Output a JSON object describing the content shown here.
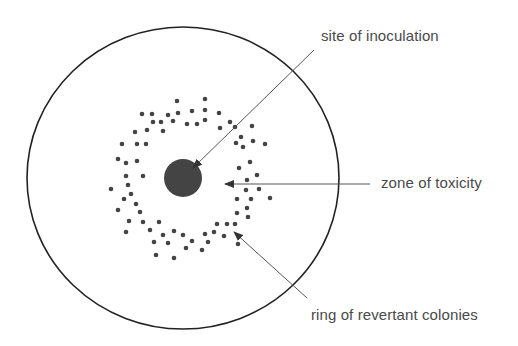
{
  "diagram": {
    "colors": {
      "outline": "#222222",
      "dots": "#444444",
      "blob": "#444444",
      "leader": "#555555",
      "text": "#4a4a4a"
    },
    "plate": {
      "cx": 183,
      "cy": 178,
      "rx": 156,
      "ry": 151
    },
    "site": {
      "cx": 183,
      "cy": 178,
      "r": 19
    },
    "labels": [
      {
        "id": "site",
        "text": "site of inoculation",
        "x": 321,
        "y": 27
      },
      {
        "id": "zone",
        "text": "zone of toxicity",
        "x": 381,
        "y": 174
      },
      {
        "id": "ring",
        "text": "ring of revertant colonies",
        "x": 311,
        "y": 306
      }
    ],
    "leaders": [
      {
        "id": "site",
        "x1": 314,
        "y1": 50,
        "x2": 193,
        "y2": 168
      },
      {
        "id": "zone",
        "x1": 370,
        "y1": 184,
        "x2": 225,
        "y2": 184
      },
      {
        "id": "ring",
        "x1": 307,
        "y1": 298,
        "x2": 234,
        "y2": 232
      }
    ],
    "colonies": [
      [
        177,
        101
      ],
      [
        205,
        99
      ],
      [
        142,
        114
      ],
      [
        152,
        114
      ],
      [
        168,
        115
      ],
      [
        178,
        113
      ],
      [
        192,
        111
      ],
      [
        205,
        110
      ],
      [
        219,
        113
      ],
      [
        153,
        122
      ],
      [
        161,
        122
      ],
      [
        173,
        121
      ],
      [
        187,
        124
      ],
      [
        197,
        124
      ],
      [
        205,
        120
      ],
      [
        230,
        122
      ],
      [
        220,
        128
      ],
      [
        235,
        127
      ],
      [
        252,
        126
      ],
      [
        135,
        132
      ],
      [
        147,
        130
      ],
      [
        163,
        131
      ],
      [
        122,
        144
      ],
      [
        137,
        144
      ],
      [
        146,
        144
      ],
      [
        241,
        137
      ],
      [
        236,
        143
      ],
      [
        253,
        141
      ],
      [
        243,
        147
      ],
      [
        265,
        144
      ],
      [
        118,
        159
      ],
      [
        126,
        163
      ],
      [
        137,
        161
      ],
      [
        250,
        162
      ],
      [
        239,
        168
      ],
      [
        143,
        176
      ],
      [
        126,
        176
      ],
      [
        257,
        175
      ],
      [
        128,
        185
      ],
      [
        247,
        180
      ],
      [
        111,
        189
      ],
      [
        131,
        194
      ],
      [
        246,
        190
      ],
      [
        259,
        189
      ],
      [
        124,
        199
      ],
      [
        237,
        199
      ],
      [
        251,
        199
      ],
      [
        270,
        198
      ],
      [
        136,
        204
      ],
      [
        118,
        210
      ],
      [
        140,
        212
      ],
      [
        247,
        208
      ],
      [
        237,
        213
      ],
      [
        248,
        217
      ],
      [
        129,
        221
      ],
      [
        143,
        222
      ],
      [
        159,
        222
      ],
      [
        217,
        224
      ],
      [
        227,
        224
      ],
      [
        235,
        224
      ],
      [
        126,
        232
      ],
      [
        150,
        230
      ],
      [
        163,
        235
      ],
      [
        174,
        231
      ],
      [
        183,
        235
      ],
      [
        205,
        234
      ],
      [
        214,
        232
      ],
      [
        224,
        236
      ],
      [
        154,
        242
      ],
      [
        168,
        243
      ],
      [
        192,
        241
      ],
      [
        208,
        242
      ],
      [
        238,
        244
      ],
      [
        186,
        248
      ],
      [
        202,
        250
      ],
      [
        156,
        255
      ],
      [
        174,
        258
      ]
    ]
  }
}
